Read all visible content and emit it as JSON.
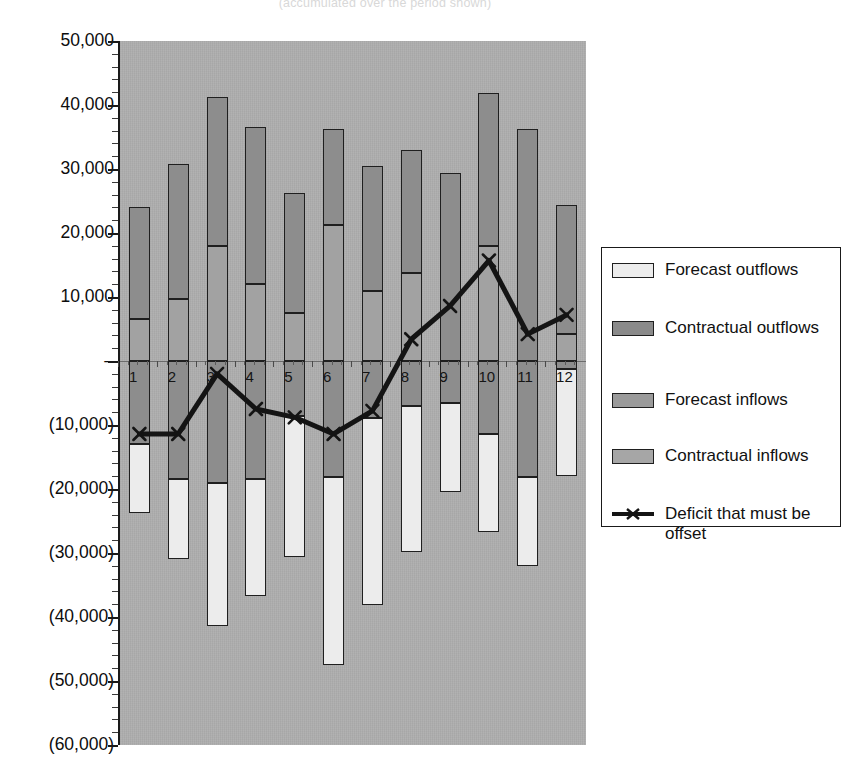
{
  "title_partial": "(accumulated over the period shown)",
  "chart_data": {
    "type": "bar",
    "subtype": "stacked-bar-with-line",
    "title": "(accumulated over the period shown)",
    "xlabel": "",
    "ylabel": "",
    "ylim": [
      -60000,
      50000
    ],
    "grid": false,
    "legend_position": "right",
    "categories": [
      "1",
      "2",
      "3",
      "4",
      "5",
      "6",
      "7",
      "8",
      "9",
      "10",
      "11",
      "12"
    ],
    "ytick_labels": [
      "50,000",
      "40,000",
      "30,000",
      "20,000",
      "10,000",
      "–",
      "(10,000)",
      "(20,000)",
      "(30,000)",
      "(40,000)",
      "(50,000)",
      "(60,000)"
    ],
    "ytick_values": [
      50000,
      40000,
      30000,
      20000,
      10000,
      0,
      -10000,
      -20000,
      -30000,
      -40000,
      -50000,
      -60000
    ],
    "series": [
      {
        "name": "Contractual inflows",
        "color": "#a2a2a2",
        "stack": "positive",
        "values": [
          6500,
          9700,
          18000,
          12000,
          7500,
          21200,
          11000,
          13700,
          0,
          18000,
          0,
          4200
        ]
      },
      {
        "name": "Forecast inflows",
        "color": "#8d8d8d",
        "stack": "positive",
        "values": [
          17500,
          21100,
          23200,
          24500,
          18800,
          15100,
          19500,
          19200,
          29300,
          23800,
          36300,
          20100
        ]
      },
      {
        "name": "Contractual outflows",
        "color": "#8d8d8d",
        "stack": "negative",
        "values": [
          -13000,
          -18500,
          -19000,
          -18500,
          -8600,
          -18200,
          -8900,
          -7000,
          -6600,
          -11400,
          -18200,
          -1200
        ]
      },
      {
        "name": "Forecast outflows",
        "color": "#ececec",
        "stack": "negative",
        "values": [
          -10700,
          -12500,
          -22400,
          -18200,
          -22100,
          -29300,
          -29200,
          -22800,
          -13900,
          -15300,
          -13900,
          -16800
        ]
      },
      {
        "name": "Deficit that must be offset",
        "color": "#141414",
        "type": "line",
        "marker": "x",
        "values": [
          -11400,
          -11400,
          -2000,
          -7500,
          -8800,
          -11400,
          -7800,
          3400,
          8600,
          15700,
          4200,
          7200
        ]
      }
    ],
    "bar_totals_positive": [
      24000,
      30800,
      41200,
      36500,
      26300,
      36300,
      30500,
      32900,
      29300,
      41800,
      36300,
      24300
    ],
    "bar_totals_negative": [
      -23700,
      -31000,
      -41400,
      -36700,
      -30700,
      -47500,
      -38100,
      -29800,
      -20500,
      -26700,
      -32100,
      -18000
    ]
  },
  "legend": {
    "items": [
      {
        "label": "Forecast outflows",
        "swatch": "fo",
        "kind": "box"
      },
      {
        "label": "Contractual outflows",
        "swatch": "co",
        "kind": "box"
      },
      {
        "label": "Forecast inflows",
        "swatch": "fi",
        "kind": "box"
      },
      {
        "label": "Contractual inflows",
        "swatch": "ci",
        "kind": "box"
      },
      {
        "label": "Deficit that must be offset",
        "swatch": "line",
        "kind": "line"
      }
    ]
  },
  "colors": {
    "plot_background": "#aeaeae",
    "axis": "#1a1a1a",
    "forecast_outflows": "#ececec",
    "contractual_outflows": "#8d8d8d",
    "forecast_inflows": "#8d8d8d",
    "contractual_inflows": "#a2a2a2",
    "deficit_line": "#141414"
  }
}
